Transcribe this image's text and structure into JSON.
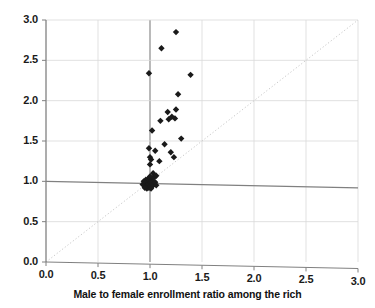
{
  "chart_data": {
    "type": "scatter",
    "title": "",
    "subtitle": "",
    "xlabel": "Male to female enrollment ratio among the rich",
    "ylabel": "",
    "xlim": [
      0.0,
      3.0
    ],
    "ylim": [
      0.0,
      3.0
    ],
    "xticks": [
      "0.0",
      "0.5",
      "1.0",
      "1.5",
      "2.0",
      "2.5",
      "3.0"
    ],
    "yticks": [
      "0.0",
      "0.5",
      "1.0",
      "1.5",
      "2.0",
      "2.5",
      "3.0"
    ],
    "xtick_values": [
      0.0,
      0.5,
      1.0,
      1.5,
      2.0,
      2.5,
      3.0
    ],
    "ytick_values": [
      0.0,
      0.5,
      1.0,
      1.5,
      2.0,
      2.5,
      3.0
    ],
    "grid": true,
    "grid_color": "#d9d9d9",
    "emphasis_lines": {
      "x": 1.0,
      "y": 1.0,
      "color": "#808080"
    },
    "reference_line": {
      "label": "45-degree equality line",
      "style": "dotted",
      "color": "#c8c8c8",
      "from": [
        0.0,
        0.0
      ],
      "to": [
        3.0,
        3.0
      ]
    },
    "legend": null,
    "legend_position": "none",
    "marker": {
      "shape": "diamond",
      "color": "#1a1a1a",
      "size": 5
    },
    "series": [
      {
        "name": "countries",
        "color": "#1a1a1a",
        "points": [
          [
            1.25,
            2.85
          ],
          [
            1.11,
            2.65
          ],
          [
            0.99,
            2.34
          ],
          [
            1.39,
            2.32
          ],
          [
            1.27,
            2.08
          ],
          [
            1.17,
            1.86
          ],
          [
            1.25,
            1.89
          ],
          [
            1.21,
            1.8
          ],
          [
            1.24,
            1.78
          ],
          [
            1.1,
            1.75
          ],
          [
            1.18,
            1.77
          ],
          [
            1.02,
            1.63
          ],
          [
            1.3,
            1.53
          ],
          [
            1.14,
            1.46
          ],
          [
            0.99,
            1.41
          ],
          [
            1.05,
            1.38
          ],
          [
            1.2,
            1.36
          ],
          [
            1.23,
            1.3
          ],
          [
            1.0,
            1.3
          ],
          [
            1.01,
            1.27
          ],
          [
            1.09,
            1.25
          ],
          [
            1.0,
            1.21
          ],
          [
            1.03,
            1.1
          ],
          [
            1.06,
            1.07
          ],
          [
            1.04,
            1.05
          ],
          [
            1.02,
            1.04
          ],
          [
            1.0,
            1.06
          ],
          [
            0.98,
            1.03
          ],
          [
            0.96,
            1.02
          ],
          [
            0.99,
            1.01
          ],
          [
            1.01,
            1.0
          ],
          [
            1.03,
            1.0
          ],
          [
            0.97,
            1.0
          ],
          [
            0.95,
            0.99
          ],
          [
            0.98,
            0.99
          ],
          [
            1.0,
            0.98
          ],
          [
            1.02,
            0.98
          ],
          [
            0.96,
            0.97
          ],
          [
            0.94,
            0.97
          ],
          [
            0.99,
            0.96
          ],
          [
            1.01,
            0.96
          ],
          [
            0.97,
            0.95
          ],
          [
            0.95,
            0.95
          ],
          [
            1.03,
            0.95
          ],
          [
            0.98,
            0.94
          ],
          [
            1.0,
            0.93
          ],
          [
            0.96,
            0.93
          ],
          [
            0.93,
            0.96
          ],
          [
            1.04,
            0.97
          ],
          [
            1.02,
            0.94
          ],
          [
            0.99,
            0.92
          ],
          [
            0.97,
            0.91
          ],
          [
            1.01,
            0.91
          ],
          [
            0.95,
            0.92
          ],
          [
            1.05,
            0.99
          ],
          [
            0.94,
            1.0
          ],
          [
            1.06,
            0.95
          ]
        ]
      }
    ]
  },
  "axis": {
    "x_title": "Male to female enrollment ratio among the rich"
  }
}
